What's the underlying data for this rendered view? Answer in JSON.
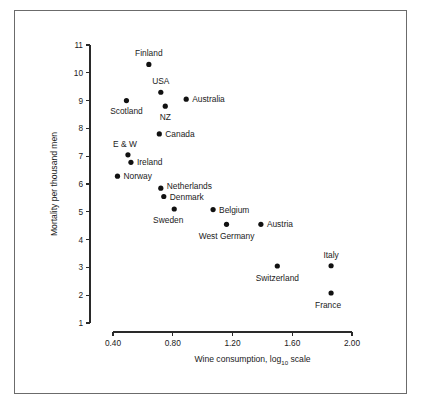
{
  "chart_data": {
    "type": "scatter",
    "title": "",
    "xlabel": "Wine consumption, log10 scale",
    "xlabel_main": "Wine consumption, log",
    "xlabel_sub": "10",
    "xlabel_tail": " scale",
    "ylabel": "Mortality per thousand men",
    "xlim": [
      0.35,
      2.05
    ],
    "ylim": [
      1,
      11
    ],
    "xticks": [
      0.4,
      0.8,
      1.2,
      1.6,
      2.0
    ],
    "xtick_labels": [
      "0.40",
      "0.80",
      "1.20",
      "1.60",
      "2.00"
    ],
    "yticks": [
      1,
      2,
      3,
      4,
      5,
      6,
      7,
      8,
      9,
      10,
      11
    ],
    "ytick_labels": [
      "1",
      "2",
      "3",
      "4",
      "5",
      "6",
      "7",
      "8",
      "9",
      "10",
      "11"
    ],
    "grid": false,
    "legend": "none",
    "marker_color": "#111111",
    "axis_color": "#2a2a2a",
    "points": [
      {
        "label": "Finland",
        "x": 0.64,
        "y": 10.3,
        "label_dx": 0,
        "label_dy": -8,
        "anchor": "middle"
      },
      {
        "label": "USA",
        "x": 0.72,
        "y": 9.3,
        "label_dx": 0,
        "label_dy": -8,
        "anchor": "middle"
      },
      {
        "label": "Scotland",
        "x": 0.49,
        "y": 9.0,
        "label_dx": 0,
        "label_dy": 13,
        "anchor": "middle"
      },
      {
        "label": "NZ",
        "x": 0.75,
        "y": 8.8,
        "label_dx": 0,
        "label_dy": 14,
        "anchor": "middle"
      },
      {
        "label": "Australia",
        "x": 0.89,
        "y": 9.05,
        "label_dx": 6,
        "label_dy": 3,
        "anchor": "start"
      },
      {
        "label": "Canada",
        "x": 0.71,
        "y": 7.8,
        "label_dx": 6,
        "label_dy": 3,
        "anchor": "start"
      },
      {
        "label": "E & W",
        "x": 0.5,
        "y": 7.05,
        "label_dx": -3,
        "label_dy": -8,
        "anchor": "middle"
      },
      {
        "label": "Ireland",
        "x": 0.52,
        "y": 6.78,
        "label_dx": 6,
        "label_dy": 3,
        "anchor": "start"
      },
      {
        "label": "Norway",
        "x": 0.43,
        "y": 6.28,
        "label_dx": 6,
        "label_dy": 3,
        "anchor": "start"
      },
      {
        "label": "Netherlands",
        "x": 0.72,
        "y": 5.85,
        "label_dx": 6,
        "label_dy": 1,
        "anchor": "start"
      },
      {
        "label": "Denmark",
        "x": 0.74,
        "y": 5.55,
        "label_dx": 6,
        "label_dy": 3,
        "anchor": "start"
      },
      {
        "label": "Sweden",
        "x": 0.81,
        "y": 5.1,
        "label_dx": -6,
        "label_dy": 14,
        "anchor": "middle"
      },
      {
        "label": "Belgium",
        "x": 1.07,
        "y": 5.08,
        "label_dx": 6,
        "label_dy": 3,
        "anchor": "start"
      },
      {
        "label": "West Germany",
        "x": 1.16,
        "y": 4.55,
        "label_dx": 0,
        "label_dy": 15,
        "anchor": "middle"
      },
      {
        "label": "Austria",
        "x": 1.39,
        "y": 4.55,
        "label_dx": 6,
        "label_dy": 3,
        "anchor": "start"
      },
      {
        "label": "Switzerland",
        "x": 1.5,
        "y": 3.05,
        "label_dx": 0,
        "label_dy": 15,
        "anchor": "middle"
      },
      {
        "label": "Italy",
        "x": 1.86,
        "y": 3.06,
        "label_dx": 0,
        "label_dy": -8,
        "anchor": "middle"
      },
      {
        "label": "France",
        "x": 1.86,
        "y": 2.08,
        "label_dx": -3,
        "label_dy": 15,
        "anchor": "middle"
      }
    ]
  }
}
